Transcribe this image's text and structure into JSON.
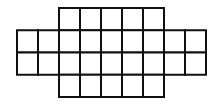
{
  "diagram": {
    "type": "grid-shape",
    "line_color": "#111111",
    "fill_color": "#ffffff",
    "cell_width": 21,
    "cell_height": 22.25,
    "origin": {
      "x": 17,
      "y": 8
    },
    "rows": [
      {
        "index": 0,
        "start_col": 2,
        "cell_count": 5
      },
      {
        "index": 1,
        "start_col": 0,
        "cell_count": 9
      },
      {
        "index": 2,
        "start_col": 0,
        "cell_count": 9
      },
      {
        "index": 3,
        "start_col": 2,
        "cell_count": 5
      }
    ],
    "total_cells": 28
  }
}
